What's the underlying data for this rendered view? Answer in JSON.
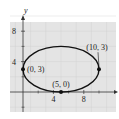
{
  "chart_data": {
    "type": "scatter",
    "title": "",
    "xlabel": "x",
    "ylabel": "y",
    "xlim": [
      -1.5,
      12
    ],
    "ylim": [
      -3,
      10
    ],
    "grid": true,
    "x_ticks": [
      {
        "value": 4,
        "label": "4"
      },
      {
        "value": 8,
        "label": "8"
      }
    ],
    "y_ticks": [
      {
        "value": 4,
        "label": "4"
      },
      {
        "value": 8,
        "label": "8"
      }
    ],
    "curve": {
      "type": "ellipse",
      "center": [
        5,
        3
      ],
      "semi_axis_x": 5,
      "semi_axis_y": 3
    },
    "points": [
      {
        "x": 0,
        "y": 3,
        "label": "(0, 3)"
      },
      {
        "x": 5,
        "y": 0,
        "label": "(5, 0)"
      },
      {
        "x": 10,
        "y": 3,
        "label": "(10, 3)"
      }
    ]
  },
  "colors": {
    "plot_background": "#e4e4e4",
    "grid": "#cfcfcf",
    "curve": "#111111",
    "axis": "#333333"
  }
}
